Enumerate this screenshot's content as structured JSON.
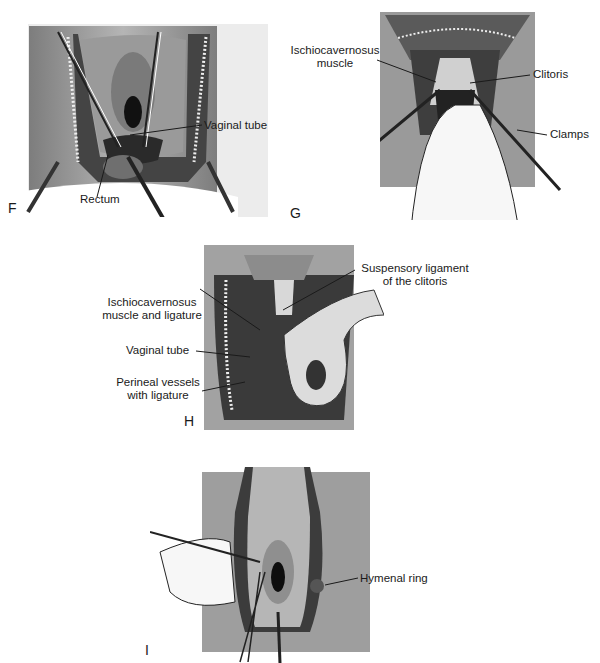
{
  "figure": {
    "panels": [
      {
        "id": "F",
        "letter": "F",
        "labels": [
          "Vaginal tube",
          "Rectum"
        ]
      },
      {
        "id": "G",
        "letter": "G",
        "labels": [
          "Ischiocavernosus muscle",
          "Clitoris",
          "Clamps"
        ]
      },
      {
        "id": "H",
        "letter": "H",
        "labels": [
          "Suspensory ligament of the clitoris",
          "Ischiocavernosus muscle and ligature",
          "Vaginal tube",
          "Perineal vessels with ligature"
        ]
      },
      {
        "id": "I",
        "letter": "I",
        "labels": [
          "Hymenal ring"
        ]
      }
    ],
    "labels": {
      "f_vaginal_tube": "Vaginal tube",
      "f_rectum": "Rectum",
      "g_ischio_line1": "Ischiocavernosus",
      "g_ischio_line2": "muscle",
      "g_clitoris": "Clitoris",
      "g_clamps": "Clamps",
      "h_susp_line1": "Suspensory ligament",
      "h_susp_line2": "of the clitoris",
      "h_ischio_line1": "Ischiocavernosus",
      "h_ischio_line2": "muscle and ligature",
      "h_vaginal_tube": "Vaginal tube",
      "h_perineal_line1": "Perineal vessels",
      "h_perineal_line2": "with ligature",
      "i_hymenal_ring": "Hymenal ring"
    },
    "letters": {
      "F": "F",
      "G": "G",
      "H": "H",
      "I": "I"
    },
    "colors": {
      "tissue_dark": "#3a3a3a",
      "tissue_mid": "#8a8a8a",
      "drape": "#a8a8a8",
      "background": "#ffffff",
      "glove": "#f4f4f4"
    }
  }
}
